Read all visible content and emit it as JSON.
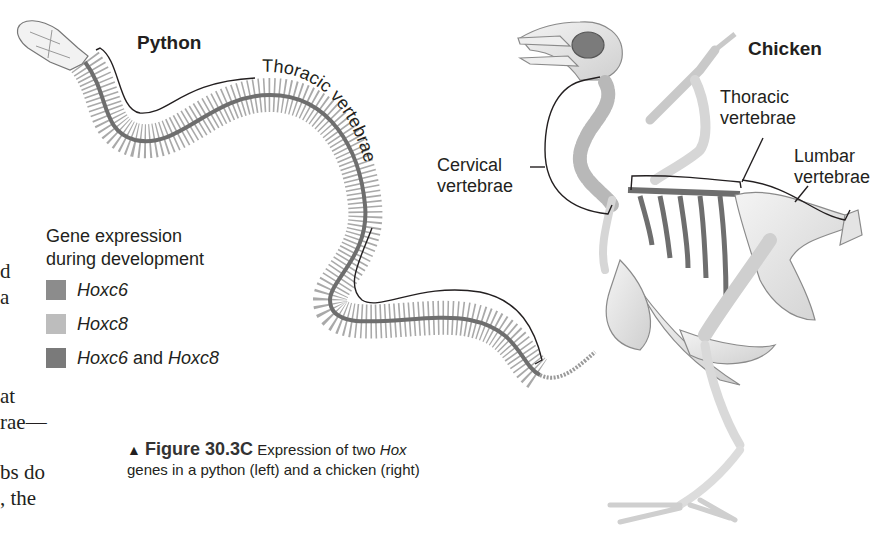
{
  "figure": {
    "python_title": "Python",
    "chicken_title": "Chicken",
    "python_labels": {
      "thoracic": "Thoracic vertebrae"
    },
    "chicken_labels": {
      "cervical_line1": "Cervical",
      "cervical_line2": "vertebrae",
      "thoracic_line1": "Thoracic",
      "thoracic_line2": "vertebrae",
      "lumbar_line1": "Lumbar",
      "lumbar_line2": "vertebrae"
    },
    "legend": {
      "title_line1": "Gene expression",
      "title_line2": "during development",
      "items": [
        {
          "part1": "Hoxc6",
          "connector": "",
          "part2": "",
          "color": "#8c8c8c"
        },
        {
          "part1": "Hoxc8",
          "connector": "",
          "part2": "",
          "color": "#bdbdbd"
        },
        {
          "part1": "Hoxc6",
          "connector": " and ",
          "part2": "Hoxc8",
          "color": "#7a7a7a"
        }
      ]
    },
    "caption": {
      "marker": "▲",
      "number": "Figure 30.3C",
      "text_before": "Expression of two ",
      "text_italic": "Hox",
      "line2": "genes in a python (left) and a chicken (right)"
    }
  },
  "body_text_fragments": [
    "d",
    "a",
    "at",
    "rae—",
    "bs do",
    ", the"
  ],
  "colors": {
    "spine_dark": "#6e6e6e",
    "rib_gray": "#8f8f8f",
    "bone_light": "#e6e6e6",
    "bone_outline": "#9a9a9a",
    "label_line": "#231f20"
  }
}
